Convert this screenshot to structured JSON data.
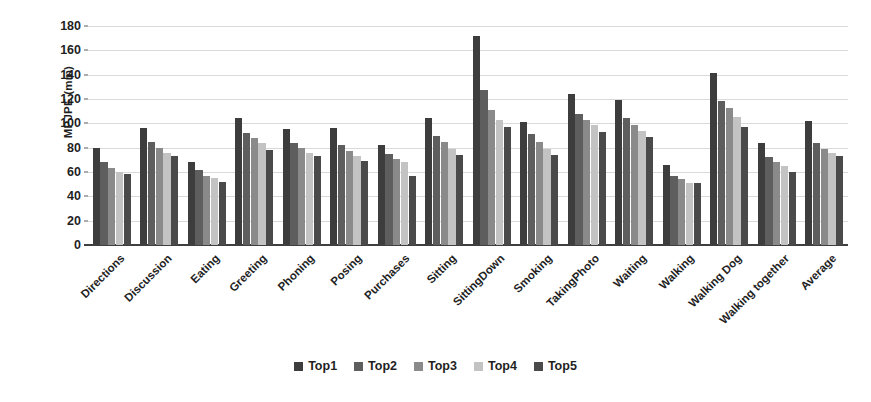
{
  "chart_data": {
    "type": "bar",
    "title": "",
    "xlabel": "",
    "ylabel": "MPJPE (mm)",
    "ylim": [
      0,
      180
    ],
    "ytick_step": 20,
    "yticks": [
      0,
      20,
      40,
      60,
      80,
      100,
      120,
      140,
      160,
      180
    ],
    "grid": true,
    "legend_position": "bottom-center",
    "categories": [
      "Directions",
      "Discussion",
      "Eating",
      "Greeting",
      "Phoning",
      "Posing",
      "Purchases",
      "Sitting",
      "SittingDown",
      "Smoking",
      "TakingPhoto",
      "Waiting",
      "Walking",
      "Walking Dog",
      "Walking together",
      "Average"
    ],
    "series": [
      {
        "name": "Top1",
        "color": "#3d3d3d",
        "values": [
          80,
          96,
          68,
          104,
          95,
          96,
          82,
          104,
          172,
          101,
          124,
          119,
          66,
          141,
          84,
          102
        ]
      },
      {
        "name": "Top2",
        "color": "#5e5e5e",
        "values": [
          68,
          85,
          62,
          92,
          84,
          82,
          75,
          90,
          127,
          91,
          108,
          104,
          57,
          118,
          72,
          84
        ]
      },
      {
        "name": "Top3",
        "color": "#8a8a8a",
        "values": [
          63,
          80,
          57,
          88,
          80,
          77,
          71,
          85,
          111,
          85,
          103,
          99,
          54,
          113,
          68,
          79
        ]
      },
      {
        "name": "Top4",
        "color": "#c3c3c3",
        "values": [
          60,
          76,
          55,
          84,
          76,
          73,
          68,
          79,
          103,
          79,
          99,
          94,
          51,
          105,
          65,
          76
        ]
      },
      {
        "name": "Top5",
        "color": "#4a4a4a",
        "values": [
          58,
          73,
          52,
          78,
          73,
          69,
          57,
          74,
          97,
          74,
          93,
          89,
          51,
          97,
          60,
          73
        ]
      }
    ]
  },
  "legend": {
    "items": [
      {
        "label": "Top1",
        "color": "#3d3d3d"
      },
      {
        "label": "Top2",
        "color": "#5e5e5e"
      },
      {
        "label": "Top3",
        "color": "#8a8a8a"
      },
      {
        "label": "Top4",
        "color": "#c3c3c3"
      },
      {
        "label": "Top5",
        "color": "#4a4a4a"
      }
    ]
  },
  "axis": {
    "y_title": "MPJPE (mm)"
  }
}
